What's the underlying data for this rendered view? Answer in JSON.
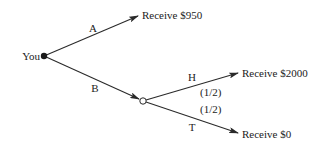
{
  "diagram": {
    "type": "decision-tree",
    "root": {
      "label": "You",
      "node_type": "decision"
    },
    "branches": [
      {
        "label": "A",
        "outcome": "Receive $950"
      },
      {
        "label": "B",
        "chance_node": {
          "outcomes": [
            {
              "label": "H",
              "probability": "(1/2)",
              "outcome": "Receive $2000"
            },
            {
              "label": "T",
              "probability": "(1/2)",
              "outcome": "Receive $0"
            }
          ]
        }
      }
    ]
  },
  "colors": {
    "line": "#2a2a2a",
    "text": "#222222",
    "background": "#ffffff"
  }
}
